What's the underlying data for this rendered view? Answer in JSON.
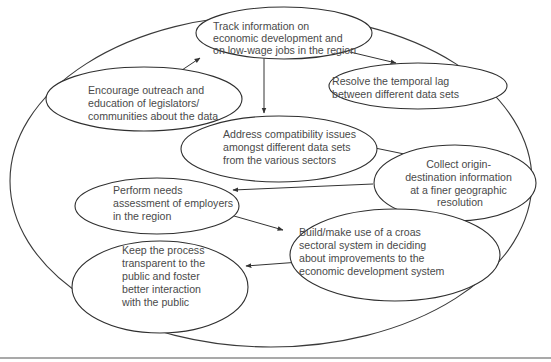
{
  "diagram": {
    "type": "process-ellipse-flow",
    "colors": {
      "stroke": "#2f2f2f",
      "text": "#4a4a4a",
      "background": "#ffffff"
    },
    "nodes": [
      {
        "id": "track",
        "lines": [
          "Track information on",
          "economic development and",
          "on low-wage jobs in the region"
        ]
      },
      {
        "id": "encourage",
        "lines": [
          "Encourage outreach and",
          "education of legislators/",
          "communities about the data"
        ]
      },
      {
        "id": "resolve",
        "lines": [
          "Resolve the temporal lag",
          "between different data sets"
        ]
      },
      {
        "id": "address",
        "lines": [
          "Address compatibility issues",
          "amongst different data sets",
          "from the various sectors"
        ]
      },
      {
        "id": "collect",
        "lines": [
          "Collect origin-",
          "destination information",
          "at a finer geographic",
          "resolution"
        ]
      },
      {
        "id": "perform",
        "lines": [
          "Perform needs",
          "assessment of employers",
          "in the region"
        ]
      },
      {
        "id": "build",
        "lines": [
          "Build/make use of a croas",
          "sectoral system in deciding",
          "about improvements to the",
          "economic development system"
        ]
      },
      {
        "id": "keep",
        "lines": [
          "Keep the process",
          "transparent to the",
          "public and foster",
          "better interaction",
          "with the public"
        ]
      }
    ],
    "edges": [
      {
        "from": "track",
        "to": "encourage",
        "bidirectional": true
      },
      {
        "from": "track",
        "to": "resolve",
        "bidirectional": false
      },
      {
        "from": "track",
        "to": "address",
        "bidirectional": false
      },
      {
        "from": "address",
        "to": "collect",
        "bidirectional": false
      },
      {
        "from": "collect",
        "to": "perform",
        "bidirectional": false
      },
      {
        "from": "perform",
        "to": "build",
        "bidirectional": false
      },
      {
        "from": "collect",
        "to": "build",
        "bidirectional": false
      },
      {
        "from": "build",
        "to": "keep",
        "bidirectional": false
      }
    ]
  }
}
